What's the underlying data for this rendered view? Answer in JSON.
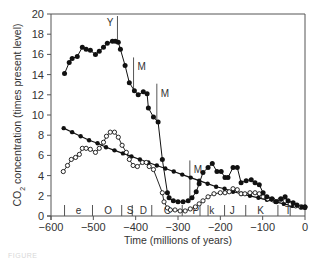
{
  "chart_data": {
    "type": "line",
    "title": "",
    "xlabel": "Time (millions of years)",
    "ylabel": "CO2 concentration (times present level)",
    "xlim": [
      -600,
      0
    ],
    "ylim": [
      0,
      20
    ],
    "x_ticks": [
      -600,
      -500,
      -400,
      -300,
      -200,
      -100,
      0
    ],
    "y_ticks": [
      0,
      2,
      4,
      6,
      8,
      10,
      12,
      14,
      16,
      18,
      20
    ],
    "grid": false,
    "legend": null,
    "series": [
      {
        "name": "upper-filled",
        "marker": "filled-circle",
        "x": [
          -568,
          -557,
          -550,
          -538,
          -526,
          -517,
          -507,
          -495,
          -486,
          -476,
          -467,
          -455,
          -448,
          -441,
          -436,
          -425,
          -415,
          -403,
          -394,
          -382,
          -373,
          -370,
          -358,
          -347,
          -337,
          -325,
          -321,
          -311,
          -300,
          -288,
          -276,
          -267,
          -257,
          -250,
          -241,
          -229,
          -219,
          -208,
          -198,
          -189,
          -182,
          -170,
          -160,
          -151,
          -139,
          -127,
          -118,
          -108,
          -99,
          -90,
          -78,
          -68,
          -57,
          -47,
          -40,
          -28,
          -19,
          -7,
          0
        ],
        "values": [
          14.1,
          15.2,
          15.6,
          15.8,
          16.7,
          16.5,
          16.4,
          16.0,
          16.3,
          16.7,
          17.1,
          17.3,
          17.3,
          17.2,
          16.5,
          14.9,
          13.2,
          12.4,
          12.0,
          12.3,
          12.1,
          10.7,
          9.8,
          9.3,
          5.6,
          2.3,
          1.8,
          1.5,
          1.4,
          1.4,
          1.5,
          1.8,
          2.4,
          3.2,
          4.3,
          4.8,
          5.2,
          4.4,
          4.4,
          3.8,
          3.8,
          4.8,
          4.8,
          3.3,
          3.5,
          3.6,
          3.3,
          3.1,
          2.3,
          1.9,
          1.7,
          1.4,
          1.7,
          1.9,
          1.5,
          1.3,
          1.1,
          0.9,
          0.9
        ]
      },
      {
        "name": "lower-open",
        "marker": "open-circle",
        "x": [
          -571,
          -561,
          -552,
          -542,
          -533,
          -526,
          -517,
          -507,
          -495,
          -486,
          -476,
          -469,
          -460,
          -450,
          -441,
          -432,
          -422,
          -415,
          -406,
          -396,
          -384,
          -375,
          -368,
          -358,
          -337,
          -333,
          -325,
          -318,
          -307,
          -295,
          -283,
          -271,
          -259,
          -250,
          -241,
          -229,
          -215,
          -200,
          -189,
          -179,
          -170,
          -160,
          -151,
          -142,
          -130,
          -118,
          -108,
          -99,
          -88,
          -76,
          -59,
          -47,
          -35,
          -22,
          -10,
          0
        ],
        "values": [
          4.4,
          5.0,
          5.6,
          5.8,
          6.1,
          6.7,
          6.7,
          6.6,
          6.3,
          6.7,
          7.3,
          7.9,
          8.3,
          8.3,
          7.8,
          7.0,
          6.3,
          5.6,
          5.0,
          4.9,
          5.3,
          5.3,
          4.9,
          4.6,
          2.3,
          1.4,
          0.8,
          0.6,
          0.6,
          0.5,
          0.5,
          0.7,
          0.9,
          1.2,
          1.5,
          1.9,
          2.2,
          2.3,
          2.3,
          2.4,
          2.7,
          2.6,
          2.2,
          2.2,
          2.3,
          2.3,
          2.2,
          1.9,
          1.7,
          1.6,
          1.6,
          1.5,
          1.2,
          1.0,
          0.9,
          0.9
        ]
      },
      {
        "name": "smooth-trend",
        "marker": "filled-circle-small",
        "x": [
          -570,
          -550,
          -530,
          -510,
          -490,
          -470,
          -450,
          -430,
          -410,
          -390,
          -370,
          -350,
          -330,
          -310,
          -290,
          -270,
          -250,
          -230,
          -210,
          -190,
          -170,
          -150,
          -130,
          -110,
          -90,
          -70,
          -50,
          -30,
          -10,
          0
        ],
        "values": [
          8.7,
          8.3,
          7.9,
          7.5,
          7.2,
          6.8,
          6.5,
          6.2,
          5.9,
          5.6,
          5.3,
          5.0,
          4.7,
          4.4,
          4.1,
          3.8,
          3.5,
          3.2,
          2.9,
          2.7,
          2.4,
          2.2,
          2.0,
          1.8,
          1.6,
          1.4,
          1.2,
          1.0,
          0.85,
          0.8
        ]
      }
    ],
    "annotations": [
      {
        "label": "Y",
        "x": -443,
        "y_top": 19.8,
        "y_bottom": 17.4
      },
      {
        "label": "M",
        "x": -405,
        "y_top": 15.7,
        "y_bottom": 12.5
      },
      {
        "label": "M",
        "x": -350,
        "y_top": 13.1,
        "y_bottom": 9.4
      },
      {
        "label": "M",
        "x": -272,
        "y_top": 5.5,
        "y_bottom": 1.6
      }
    ],
    "periods": [
      {
        "label": "e",
        "x": -535
      },
      {
        "label": "O",
        "x": -465
      },
      {
        "label": "S",
        "x": -413
      },
      {
        "label": "D",
        "x": -382
      },
      {
        "label": "C",
        "x": -325
      },
      {
        "label": "P",
        "x": -258
      },
      {
        "label": "k",
        "x": -220
      },
      {
        "label": "J",
        "x": -172
      },
      {
        "label": "K",
        "x": -105
      },
      {
        "label": "T",
        "x": -40
      }
    ],
    "period_boundaries": [
      -568,
      -502,
      -433,
      -408,
      -362,
      -290,
      -248,
      -229,
      -190,
      -140,
      -64,
      -35
    ]
  },
  "labels": {
    "x_axis_title": "Time (millions of years)",
    "y_axis_title_prefix": "CO",
    "y_axis_title_sub": "2",
    "y_axis_title_suffix": " concentration (times present level)",
    "caption": "FIGURE"
  }
}
